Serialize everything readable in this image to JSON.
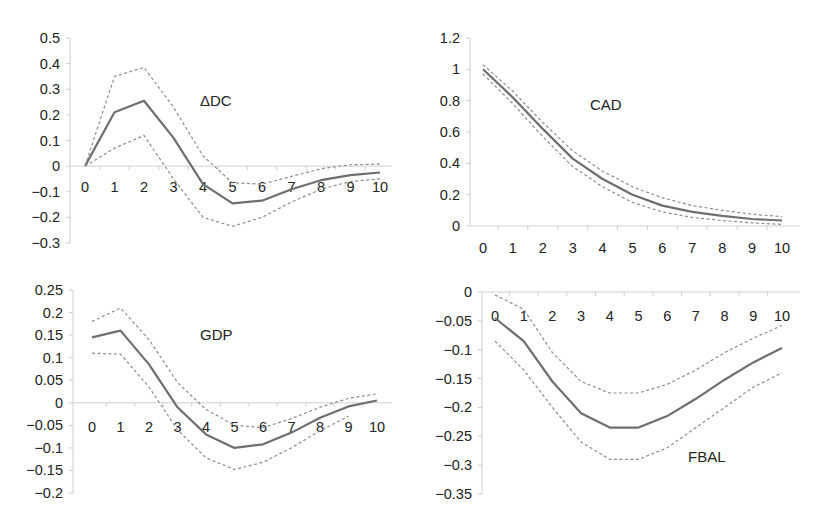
{
  "figure": {
    "layout": "2x2 grid of impulse response panels",
    "style": {
      "mid_line_color": "#6e6e6e",
      "band_line_color": "#8c8c8c",
      "axis_color": "#cfcfcf",
      "text_color": "#222222"
    }
  },
  "chart_data": [
    {
      "type": "line",
      "title": "ΔDC",
      "x": [
        0,
        1,
        2,
        3,
        4,
        5,
        6,
        7,
        8,
        9,
        10
      ],
      "x_tick_labels": [
        "0",
        "1",
        "2",
        "3",
        "4",
        "5",
        "6",
        "7",
        "8",
        "9",
        "10"
      ],
      "y_tick_labels": [
        "0.5",
        "0.4",
        "0.3",
        "0.2",
        "0.1",
        "0",
        "−0.1",
        "−0.2",
        "−0.3"
      ],
      "ylim": [
        -0.3,
        0.5
      ],
      "grid": false,
      "legend": null,
      "series": [
        {
          "name": "response",
          "style": "solid",
          "values": [
            0,
            0.21,
            0.255,
            0.11,
            -0.07,
            -0.145,
            -0.135,
            -0.09,
            -0.055,
            -0.035,
            -0.025
          ]
        },
        {
          "name": "upper band",
          "style": "dashed",
          "values": [
            0,
            0.35,
            0.385,
            0.23,
            0.04,
            -0.065,
            -0.07,
            -0.04,
            -0.01,
            0.005,
            0.008
          ]
        },
        {
          "name": "lower band",
          "style": "dashed",
          "values": [
            0,
            0.07,
            0.12,
            -0.05,
            -0.2,
            -0.235,
            -0.2,
            -0.14,
            -0.09,
            -0.06,
            -0.05
          ]
        }
      ]
    },
    {
      "type": "line",
      "title": "CAD",
      "x": [
        0,
        1,
        2,
        3,
        4,
        5,
        6,
        7,
        8,
        9,
        10
      ],
      "x_tick_labels": [
        "0",
        "1",
        "2",
        "3",
        "4",
        "5",
        "6",
        "7",
        "8",
        "9",
        "10"
      ],
      "y_tick_labels": [
        "1.2",
        "1",
        "0.8",
        "0.6",
        "0.4",
        "0.2",
        "0"
      ],
      "ylim": [
        0,
        1.2
      ],
      "grid": false,
      "legend": null,
      "series": [
        {
          "name": "response",
          "style": "solid",
          "values": [
            1.0,
            0.82,
            0.62,
            0.43,
            0.3,
            0.2,
            0.13,
            0.09,
            0.065,
            0.045,
            0.035
          ]
        },
        {
          "name": "upper band",
          "style": "dashed",
          "values": [
            1.03,
            0.86,
            0.66,
            0.48,
            0.35,
            0.25,
            0.18,
            0.13,
            0.1,
            0.075,
            0.06
          ]
        },
        {
          "name": "lower band",
          "style": "dashed",
          "values": [
            0.97,
            0.78,
            0.57,
            0.38,
            0.25,
            0.15,
            0.09,
            0.055,
            0.035,
            0.02,
            0.01
          ]
        }
      ]
    },
    {
      "type": "line",
      "title": "GDP",
      "x": [
        0,
        1,
        2,
        3,
        4,
        5,
        6,
        7,
        8,
        9,
        10
      ],
      "x_tick_labels": [
        "0",
        "1",
        "2",
        "3",
        "4",
        "5",
        "6",
        "7",
        "8",
        "9",
        "10"
      ],
      "y_tick_labels": [
        "0.25",
        "0.2",
        "0.15",
        "0.1",
        "0.05",
        "0",
        "−0.05",
        "−0.1",
        "−0.15",
        "−0.2"
      ],
      "ylim": [
        -0.2,
        0.25
      ],
      "grid": false,
      "legend": null,
      "series": [
        {
          "name": "response",
          "style": "solid",
          "values": [
            0.145,
            0.16,
            0.085,
            -0.01,
            -0.07,
            -0.1,
            -0.092,
            -0.066,
            -0.033,
            -0.008,
            0.005
          ]
        },
        {
          "name": "upper band",
          "style": "dashed",
          "values": [
            0.18,
            0.21,
            0.14,
            0.045,
            -0.015,
            -0.05,
            -0.055,
            -0.035,
            -0.01,
            0.01,
            0.02
          ]
        },
        {
          "name": "lower band",
          "style": "dashed",
          "values": [
            0.11,
            0.108,
            0.035,
            -0.06,
            -0.122,
            -0.148,
            -0.132,
            -0.1,
            -0.062,
            -0.03,
            null
          ]
        }
      ]
    },
    {
      "type": "line",
      "title": "FBAL",
      "x": [
        0,
        1,
        2,
        3,
        4,
        5,
        6,
        7,
        8,
        9,
        10
      ],
      "x_tick_labels": [
        "0",
        "1",
        "2",
        "3",
        "4",
        "5",
        "6",
        "7",
        "8",
        "9",
        "10"
      ],
      "y_tick_labels": [
        "0",
        "−0.05",
        "−0.1",
        "−0.15",
        "−0.2",
        "−0.25",
        "−0.3",
        "−0.35"
      ],
      "ylim": [
        -0.35,
        0
      ],
      "grid": false,
      "legend": null,
      "series": [
        {
          "name": "response",
          "style": "solid",
          "values": [
            -0.045,
            -0.085,
            -0.155,
            -0.21,
            -0.235,
            -0.235,
            -0.215,
            -0.185,
            -0.152,
            -0.122,
            -0.097
          ]
        },
        {
          "name": "upper band",
          "style": "dashed",
          "values": [
            -0.005,
            -0.03,
            -0.105,
            -0.155,
            -0.175,
            -0.175,
            -0.16,
            -0.135,
            -0.105,
            -0.08,
            -0.058
          ]
        },
        {
          "name": "lower band",
          "style": "dashed",
          "values": [
            -0.085,
            -0.135,
            -0.2,
            -0.26,
            -0.29,
            -0.29,
            -0.27,
            -0.235,
            -0.2,
            -0.165,
            -0.14
          ]
        }
      ]
    }
  ],
  "panels_layout": [
    {
      "axis_x": 70,
      "y_top": 38,
      "y_bottom": 243,
      "x0": 85,
      "dx": 29.5,
      "xlabel_y": 192,
      "xaxis_value": 0,
      "x_end": 392,
      "title_x": 200,
      "title_y": 106
    },
    {
      "axis_x": 470,
      "y_top": 38,
      "y_bottom": 226,
      "x0": 483,
      "dx": 29.9,
      "xlabel_y": 253,
      "xaxis_value": 0,
      "x_end": 800,
      "title_x": 590,
      "title_y": 110
    },
    {
      "axis_x": 73,
      "y_top": 290,
      "y_bottom": 493,
      "x0": 92,
      "dx": 28.5,
      "xlabel_y": 432,
      "xaxis_value": 0,
      "x_end": 392,
      "title_x": 200,
      "title_y": 340
    },
    {
      "axis_x": 482,
      "y_top": 292,
      "y_bottom": 494,
      "x0": 495,
      "dx": 28.7,
      "xlabel_y": 321,
      "xaxis_value": 0,
      "x_end": 800,
      "title_x": 688,
      "title_y": 462
    }
  ]
}
